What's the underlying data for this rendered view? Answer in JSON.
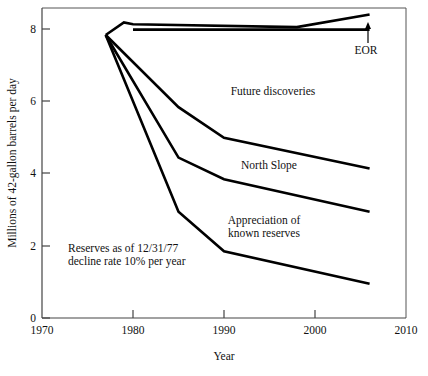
{
  "chart_data": {
    "type": "line",
    "title": "",
    "xlabel": "Year",
    "ylabel": "Millions of 42-gallon barrels per day",
    "xlim": [
      1970,
      2010
    ],
    "ylim": [
      0,
      8.6
    ],
    "xticks": [
      1970,
      1980,
      1990,
      2000,
      2010
    ],
    "xtick_labels": [
      "1970",
      "1980",
      "1990",
      "2000",
      "2010"
    ],
    "yticks": [
      0,
      2,
      4,
      6,
      8
    ],
    "ytick_labels": [
      "0",
      "2",
      "4",
      "6",
      "8"
    ],
    "grid": false,
    "legend": "none",
    "series": [
      {
        "name": "Total including future discoveries",
        "x": [
          1977,
          1979,
          1980,
          1998,
          2006
        ],
        "values": [
          7.85,
          8.2,
          8.15,
          8.07,
          8.42
        ]
      },
      {
        "name": "EOR boundary (flat reference)",
        "x": [
          1980,
          2006
        ],
        "values": [
          8.0,
          8.0
        ]
      },
      {
        "name": "North Slope upper boundary",
        "x": [
          1977,
          1985,
          1990,
          2006
        ],
        "values": [
          7.85,
          5.85,
          5.0,
          4.15
        ]
      },
      {
        "name": "Appreciation of known reserves upper boundary",
        "x": [
          1977,
          1985,
          1990,
          2006
        ],
        "values": [
          7.85,
          4.45,
          3.85,
          2.95
        ]
      },
      {
        "name": "Reserves as of 12/31/77, decline rate 10% per year",
        "x": [
          1977,
          1985,
          1990,
          2006
        ],
        "values": [
          7.85,
          2.95,
          1.85,
          0.95
        ]
      }
    ],
    "annotations": [
      {
        "name": "eor",
        "text": "EOR",
        "x": 2004,
        "y": 7.45
      },
      {
        "name": "future-discoveries",
        "text": "Future discoveries",
        "x": 1992.5,
        "y": 6.3
      },
      {
        "name": "north-slope",
        "text": "North Slope",
        "x": 1991.5,
        "y": 4.25
      },
      {
        "name": "appreciation-line1",
        "text": "Appreciation of",
        "x": 1991,
        "y": 2.72
      },
      {
        "name": "appreciation-line2",
        "text": "known reserves",
        "x": 1991,
        "y": 2.42
      },
      {
        "name": "reserves-line1",
        "text": "Reserves as of 12/31/77",
        "x": 1977.5,
        "y": 1.95
      },
      {
        "name": "reserves-line2",
        "text": "decline rate 10% per year",
        "x": 1977.5,
        "y": 1.65
      }
    ]
  }
}
